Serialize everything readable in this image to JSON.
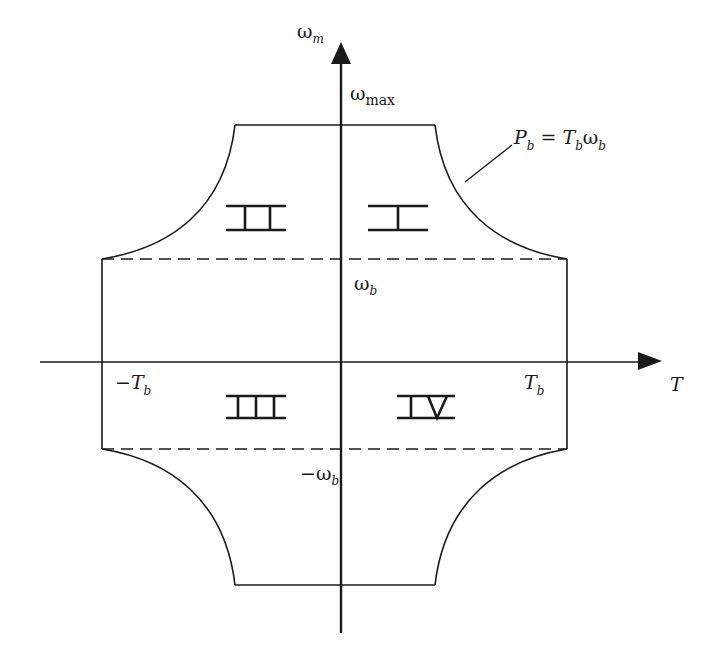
{
  "diagram": {
    "colors": {
      "stroke": "#1a1a1a",
      "background": "#ffffff"
    },
    "axes": {
      "y_axis": {
        "symbol": "ω",
        "subscript": "m"
      },
      "x_axis": {
        "symbol": "T"
      }
    },
    "labels": {
      "omega_max": {
        "symbol": "ω",
        "subscript": "max"
      },
      "omega_b": {
        "symbol": "ω",
        "subscript": "b"
      },
      "neg_omega_b": {
        "symbol": "−ω",
        "subscript": "b"
      },
      "T_b": {
        "symbol": "T",
        "subscript": "b"
      },
      "neg_T_b": {
        "symbol": "−T",
        "subscript": "b"
      },
      "power_eq": {
        "p": "P",
        "p_sub": "b",
        "eq": " = ",
        "t": "T",
        "t_sub": "b",
        "w": "ω",
        "w_sub": "b"
      }
    },
    "quadrants": [
      {
        "id": "I",
        "label": "I"
      },
      {
        "id": "II",
        "label": "II"
      },
      {
        "id": "III",
        "label": "III"
      },
      {
        "id": "IV",
        "label": "IV"
      }
    ],
    "boundary": {
      "constant_torque_region": "dashed lines at ±ω_b",
      "constant_power_region": "hyperbolic curves P_b = T_b ω_b"
    }
  }
}
